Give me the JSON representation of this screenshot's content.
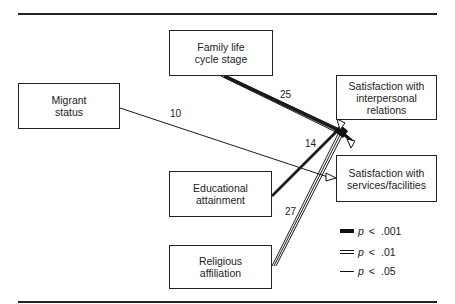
{
  "diagram": {
    "type": "path-diagram",
    "nodes": [
      {
        "id": "migrant",
        "label": "Migrant\nstatus"
      },
      {
        "id": "family",
        "label": "Family life\ncycle stage"
      },
      {
        "id": "education",
        "label": "Educational\nattainment"
      },
      {
        "id": "religion",
        "label": "Religious\naffiliation"
      },
      {
        "id": "interpersonal",
        "label": "Satisfaction with\ninterpersonal\nrelations"
      },
      {
        "id": "services",
        "label": "Satisfaction with\nservices/facilities"
      }
    ],
    "edges": [
      {
        "from": "family",
        "to": "interpersonal",
        "coef": ".25",
        "significance": "p < .001"
      },
      {
        "from": "migrant",
        "to": "services",
        "coef": ".10",
        "significance": "p < .05"
      },
      {
        "from": "education",
        "to": "interpersonal",
        "coef": ".14",
        "significance": "p < .001"
      },
      {
        "from": "religion",
        "to": "interpersonal",
        "coef": ".27",
        "significance": "p < .01"
      }
    ],
    "coef_labels": {
      "family": "25",
      "migrant": "10",
      "education": "14",
      "religion": "27"
    },
    "legend": [
      {
        "style": "thick",
        "p": "p",
        "op": "<",
        "value": ".001"
      },
      {
        "style": "double",
        "p": "p",
        "op": "<",
        "value": ".01"
      },
      {
        "style": "single",
        "p": "p",
        "op": "<",
        "value": ".05"
      }
    ]
  }
}
